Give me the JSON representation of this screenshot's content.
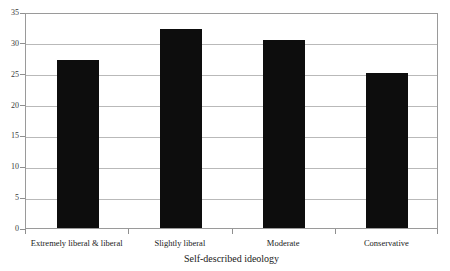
{
  "figure": {
    "title_remnant": "",
    "background_color": "#ffffff",
    "bar_color": "#0d0d0d",
    "grid_color": "#b9b9b9",
    "frame_color": "#9a9a9a"
  },
  "chart_data": {
    "type": "bar",
    "title": "",
    "xlabel": "Self-described ideology",
    "ylabel": "",
    "categories": [
      "Extremely liberal & liberal",
      "Slightly liberal",
      "Moderate",
      "Conservative"
    ],
    "values": [
      27.3,
      32.2,
      30.5,
      25.1
    ],
    "ylim": [
      0,
      35
    ],
    "yticks": [
      0,
      5,
      10,
      15,
      20,
      25,
      30,
      35
    ],
    "ytick_labels": [
      "0",
      "5",
      "10",
      "15",
      "20",
      "25",
      "30",
      "35"
    ],
    "grid": true,
    "grid_axis": "y",
    "legend": null,
    "legend_position": "none",
    "bar_color": "#0d0d0d",
    "orientation": "vertical"
  }
}
